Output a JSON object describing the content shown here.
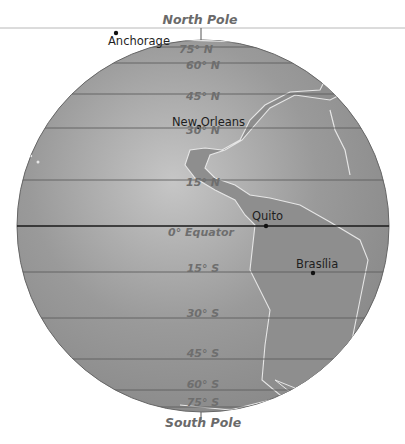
{
  "map": {
    "poles": {
      "north": "North Pole",
      "south": "South Pole"
    },
    "latitudes": [
      {
        "label": "75° N",
        "y": 47
      },
      {
        "label": "60° N",
        "y": 63
      },
      {
        "label": "45° N",
        "y": 94
      },
      {
        "label": "30° N",
        "y": 128
      },
      {
        "label": "15° N",
        "y": 180
      },
      {
        "label": "0° Equator",
        "y": 226
      },
      {
        "label": "15° S",
        "y": 272
      },
      {
        "label": "30° S",
        "y": 318
      },
      {
        "label": "45° S",
        "y": 359
      },
      {
        "label": "60° S",
        "y": 390
      },
      {
        "label": "75° S",
        "y": 407
      }
    ],
    "cities": [
      {
        "name": "Anchorage"
      },
      {
        "name": "New Orleans"
      },
      {
        "name": "Quito"
      },
      {
        "name": "Brasília"
      }
    ],
    "colors": {
      "globe": "#8f8f8f",
      "highlight": "#c9c9c9",
      "coast": "#e6e6e6",
      "grid": "#5a5a5a",
      "equator": "#1a1a1a"
    }
  }
}
